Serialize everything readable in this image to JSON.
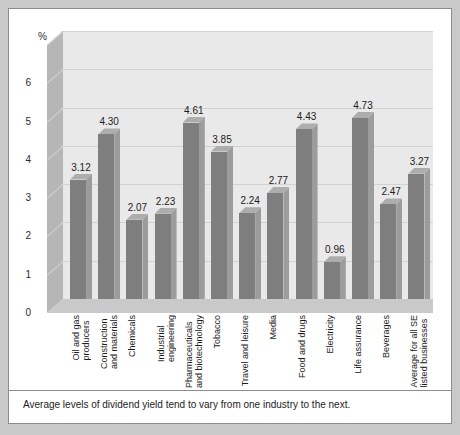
{
  "caption": "Average levels of dividend yield tend to vary from one industry to the next.",
  "chart_data": {
    "type": "bar",
    "title": "",
    "xlabel": "",
    "ylabel": "%",
    "ylim": [
      0,
      7
    ],
    "yticks": [
      "0",
      "1",
      "2",
      "3",
      "4",
      "5",
      "6"
    ],
    "y_unit_label": "%",
    "grid": true,
    "legend": "none",
    "style": "3d-column",
    "bar_color": "#7e7e7e",
    "plot_background": "#e9e9e9",
    "categories": [
      "Oil and gas\nproducers",
      "Construction\nand materials",
      "Chemicals",
      "Industrial\nengineering",
      "Pharmaceuticals\nand biotechnology",
      "Tobacco",
      "Travel and leisure",
      "Media",
      "Food and drugs",
      "Electricity",
      "Life assurance",
      "Beverages",
      "Average for all SE\nlisted businesses"
    ],
    "values": [
      3.12,
      4.3,
      2.07,
      2.23,
      4.61,
      3.85,
      2.24,
      2.77,
      4.43,
      0.96,
      4.73,
      2.47,
      3.27
    ],
    "value_labels": [
      "3.12",
      "4.30",
      "2.07",
      "2.23",
      "4.61",
      "3.85",
      "2.24",
      "2.77",
      "4.43",
      "0.96",
      "4.73",
      "2.47",
      "3.27"
    ]
  }
}
